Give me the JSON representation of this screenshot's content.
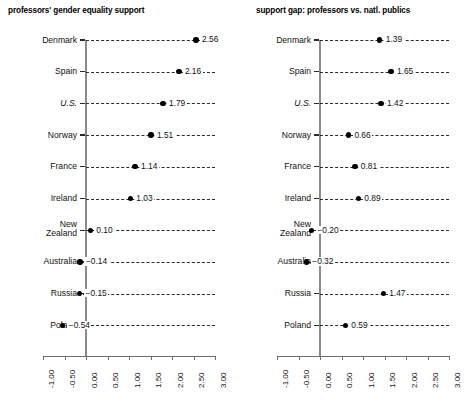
{
  "chart_data": [
    {
      "type": "scatter",
      "title": "professors' gender equality support",
      "xlabel": "",
      "ylabel": "",
      "xlim": [
        -1.0,
        3.0
      ],
      "xticks": [
        "-1.00",
        "-0.50",
        "0.00",
        "0.50",
        "1.00",
        "1.50",
        "2.00",
        "2.50",
        "3.00"
      ],
      "xtick_values": [
        -1.0,
        -0.5,
        0.0,
        0.5,
        1.0,
        1.5,
        2.0,
        2.5,
        3.0
      ],
      "grid": false,
      "legend": "none",
      "categories": [
        "Denmark",
        "Spain",
        "U.S.",
        "Norway",
        "France",
        "Ireland",
        "New Zealand",
        "Australia",
        "Russia",
        "Poland"
      ],
      "values": [
        2.56,
        2.16,
        1.79,
        1.51,
        1.14,
        1.03,
        0.1,
        -0.14,
        -0.15,
        -0.54
      ],
      "value_labels": [
        "2.56",
        "2.16",
        "1.79",
        "1.51",
        "1.14",
        "1.03",
        "0.10",
        "−0.14",
        "−0.15",
        "−0.54"
      ]
    },
    {
      "type": "scatter",
      "title": "support gap: professors vs. natl. publics",
      "xlabel": "",
      "ylabel": "",
      "xlim": [
        -1.0,
        3.0
      ],
      "xticks": [
        "-1.00",
        "-0.50",
        "0.00",
        "0.50",
        "1.00",
        "1.50",
        "2.00",
        "2.50",
        "3.00"
      ],
      "xtick_values": [
        -1.0,
        -0.5,
        0.0,
        0.5,
        1.0,
        1.5,
        2.0,
        2.5,
        3.0
      ],
      "grid": false,
      "legend": "none",
      "categories": [
        "Denmark",
        "Spain",
        "U.S.",
        "Norway",
        "France",
        "Ireland",
        "New Zealand",
        "Australia",
        "Russia",
        "Poland"
      ],
      "values": [
        1.39,
        1.65,
        1.42,
        0.66,
        0.81,
        0.89,
        -0.2,
        -0.32,
        1.47,
        0.59
      ],
      "value_labels": [
        "1.39",
        "1.65",
        "1.42",
        "0.66",
        "0.81",
        "0.89",
        "−0.20",
        "−0.32",
        "1.47",
        "0.59"
      ]
    }
  ],
  "style": {
    "dot_color": "#000000",
    "axis_color": "#8a8a8a",
    "dash_color": "#2b2b2b",
    "text_color": "#111111"
  },
  "labels": {
    "new_zealand_line1": "New",
    "new_zealand_line2": "Zealand"
  }
}
